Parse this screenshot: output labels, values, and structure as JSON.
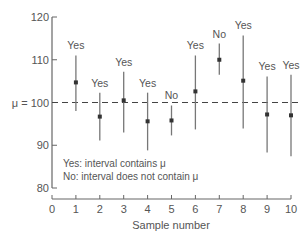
{
  "chart_data": {
    "type": "scatter",
    "subtype": "confidence-intervals",
    "title": "",
    "xlabel": "Sample number",
    "ylabel": "",
    "xlim": [
      0,
      10
    ],
    "ylim": [
      80,
      120
    ],
    "x_ticks": [
      "0",
      "1",
      "2",
      "3",
      "4",
      "5",
      "6",
      "7",
      "8",
      "9",
      "10"
    ],
    "y_ticks": [
      "80",
      "90",
      "100",
      "110",
      "120"
    ],
    "reference_line": {
      "label": "μ = 100",
      "value": 100,
      "style": "dashed"
    },
    "grid": false,
    "points": [
      {
        "x": 1,
        "mean": 104.7,
        "lower": 98.0,
        "upper": 111.0,
        "label": "Yes"
      },
      {
        "x": 2,
        "mean": 96.7,
        "lower": 91.1,
        "upper": 102.3,
        "label": "Yes"
      },
      {
        "x": 3,
        "mean": 100.5,
        "lower": 93.0,
        "upper": 107.2,
        "label": "Yes"
      },
      {
        "x": 4,
        "mean": 95.6,
        "lower": 88.8,
        "upper": 102.3,
        "label": "Yes"
      },
      {
        "x": 5,
        "mean": 95.8,
        "lower": 92.3,
        "upper": 99.3,
        "label": "No"
      },
      {
        "x": 6,
        "mean": 102.6,
        "lower": 93.7,
        "upper": 111.0,
        "label": "Yes"
      },
      {
        "x": 7,
        "mean": 110.0,
        "lower": 106.5,
        "upper": 113.8,
        "label": "No"
      },
      {
        "x": 8,
        "mean": 105.1,
        "lower": 93.9,
        "upper": 115.7,
        "label": "Yes"
      },
      {
        "x": 9,
        "mean": 97.2,
        "lower": 88.3,
        "upper": 106.1,
        "label": "Yes"
      },
      {
        "x": 10,
        "mean": 97.0,
        "lower": 87.4,
        "upper": 106.5,
        "label": "Yes"
      }
    ],
    "legend": [
      "Yes: interval contains μ",
      "No: interval does not contain μ"
    ],
    "colors": {
      "axis": "#666666",
      "interval": "#777777",
      "point": "#333333",
      "reference": "#444444",
      "text": "#555555"
    }
  }
}
